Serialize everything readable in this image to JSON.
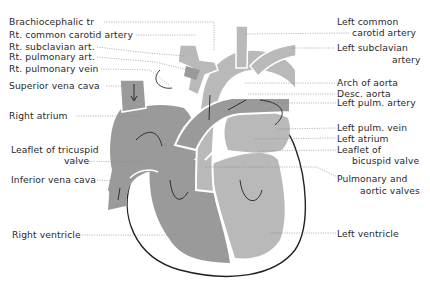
{
  "diagram": {
    "type": "anatomical-diagram",
    "colors": {
      "right_side_fill": "#9a9a9a",
      "left_side_fill": "#b9b9b9",
      "outline": "#222222",
      "leader_line": "#8a8a8a",
      "background": "#ffffff"
    }
  },
  "labels_left": [
    {
      "id": "brachiocephalic",
      "text": "Brachiocephalic tr"
    },
    {
      "id": "rt-common-carotid",
      "text": "Rt. common carotid artery"
    },
    {
      "id": "rt-subclavian",
      "text": "Rt. subclavian art."
    },
    {
      "id": "rt-pulmonary-art",
      "text": "Rt. pulmonary art."
    },
    {
      "id": "rt-pulmonary-vein",
      "text": "Rt. pulmonary vein"
    },
    {
      "id": "superior-vena-cava",
      "text": "Superior vena cava"
    },
    {
      "id": "right-atrium",
      "text": "Right atrium"
    },
    {
      "id": "tricuspid-leaflet-1",
      "text": "Leaflet of tricuspid"
    },
    {
      "id": "tricuspid-leaflet-2",
      "text": "valve"
    },
    {
      "id": "inferior-vena-cava",
      "text": "Inferior vena cava"
    },
    {
      "id": "right-ventricle",
      "text": "Right ventricle"
    }
  ],
  "labels_right": [
    {
      "id": "left-common-carotid-1",
      "text": "Left common"
    },
    {
      "id": "left-common-carotid-2",
      "text": "carotid artery"
    },
    {
      "id": "left-subclavian-1",
      "text": "Left subclavian"
    },
    {
      "id": "left-subclavian-2",
      "text": "artery"
    },
    {
      "id": "arch-of-aorta",
      "text": "Arch of aorta"
    },
    {
      "id": "desc-aorta",
      "text": "Desc. aorta"
    },
    {
      "id": "left-pulm-artery",
      "text": "Left pulm. artery"
    },
    {
      "id": "left-pulm-vein",
      "text": "Left pulm. vein"
    },
    {
      "id": "left-atrium",
      "text": "Left atrium"
    },
    {
      "id": "bicuspid-leaflet-1",
      "text": "Leaflet of"
    },
    {
      "id": "bicuspid-leaflet-2",
      "text": "bicuspid valve"
    },
    {
      "id": "pulm-aortic-valves-1",
      "text": "Pulmonary and"
    },
    {
      "id": "pulm-aortic-valves-2",
      "text": "aortic valves"
    },
    {
      "id": "left-ventricle",
      "text": "Left ventricle"
    }
  ]
}
